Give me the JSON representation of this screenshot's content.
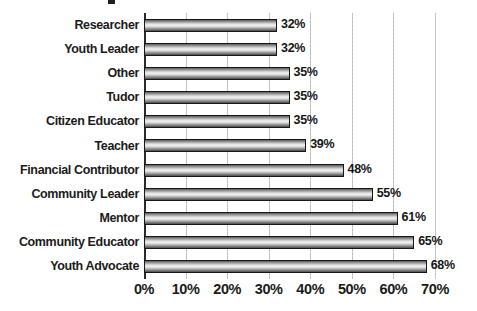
{
  "chart_data": {
    "type": "bar",
    "orientation": "horizontal",
    "title": "",
    "xlabel": "",
    "ylabel": "",
    "categories": [
      "Researcher",
      "Youth Leader",
      "Other",
      "Tudor",
      "Citizen Educator",
      "Teacher",
      "Financial Contributor",
      "Community Leader",
      "Mentor",
      "Community Educator",
      "Youth Advocate"
    ],
    "values": [
      32,
      32,
      35,
      35,
      35,
      39,
      48,
      55,
      61,
      65,
      68
    ],
    "value_labels": [
      "32%",
      "32%",
      "35%",
      "35%",
      "35%",
      "39%",
      "48%",
      "55%",
      "61%",
      "65%",
      "68%"
    ],
    "xlim": [
      0,
      70
    ],
    "xticks": [
      0,
      10,
      20,
      30,
      40,
      50,
      60,
      70
    ],
    "xtick_labels": [
      "0%",
      "10%",
      "20%",
      "30%",
      "40%",
      "50%",
      "60%",
      "70%"
    ],
    "grid": "vertical-dotted",
    "legend": "none",
    "bar_border_color": "#171717",
    "bar_fill": "gray-gradient",
    "gridline_color": "#bdbdbd",
    "text_color": "#1b1b1b",
    "background_color": "#ffffff"
  },
  "title_remnant": {
    "note": "cropped title above top edge",
    "text": "Role"
  }
}
